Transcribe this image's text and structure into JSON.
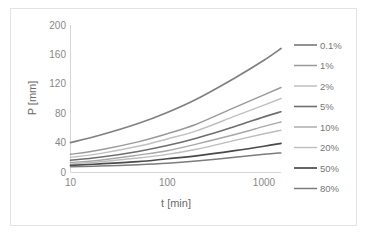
{
  "chart_data": {
    "type": "line",
    "title": "",
    "xlabel": "t [min]",
    "ylabel": "P [mm]",
    "xscale": "log",
    "xlim": [
      10,
      1500
    ],
    "ylim": [
      0,
      200
    ],
    "xticks": [
      10,
      100,
      1000
    ],
    "xtick_labels": [
      "10",
      "100",
      "1000"
    ],
    "yticks": [
      0,
      40,
      80,
      120,
      160,
      200
    ],
    "ytick_labels": [
      "0",
      "40",
      "80",
      "120",
      "160",
      "200"
    ],
    "grid": false,
    "legend_position": "right",
    "x": [
      10,
      20,
      50,
      100,
      200,
      500,
      1000,
      1500
    ],
    "series": [
      {
        "name": "0.1%",
        "color": "#808080",
        "width": 1.7,
        "values": [
          40,
          50,
          66,
          81,
          99,
          128,
          152,
          168
        ]
      },
      {
        "name": "1%",
        "color": "#9a9a9a",
        "width": 1.5,
        "values": [
          24,
          30,
          41,
          52,
          65,
          88,
          105,
          115
        ]
      },
      {
        "name": "2%",
        "color": "#c0c0c0",
        "width": 1.5,
        "values": [
          20,
          25,
          35,
          45,
          56,
          76,
          91,
          100
        ]
      },
      {
        "name": "5%",
        "color": "#6e6e6e",
        "width": 1.6,
        "values": [
          16,
          20,
          28,
          36,
          46,
          62,
          75,
          82
        ]
      },
      {
        "name": "10%",
        "color": "#a8a8a8",
        "width": 1.4,
        "values": [
          13,
          16,
          23,
          29,
          38,
          51,
          62,
          68
        ]
      },
      {
        "name": "20%",
        "color": "#bdbdbd",
        "width": 1.4,
        "values": [
          11,
          14,
          19,
          24,
          31,
          43,
          52,
          57
        ]
      },
      {
        "name": "50%",
        "color": "#4a4a4a",
        "width": 1.7,
        "values": [
          9,
          11,
          14,
          18,
          22,
          29,
          35,
          39
        ]
      },
      {
        "name": "80%",
        "color": "#7c7c7c",
        "width": 1.5,
        "values": [
          7,
          8,
          10,
          12,
          15,
          20,
          24,
          26
        ]
      }
    ]
  },
  "axes": {
    "y_title": "P [mm]",
    "x_title": "t [min]"
  },
  "legend": {
    "entries": [
      {
        "label": "0.1%",
        "color": "#808080"
      },
      {
        "label": "1%",
        "color": "#9a9a9a"
      },
      {
        "label": "2%",
        "color": "#c0c0c0"
      },
      {
        "label": "5%",
        "color": "#6e6e6e"
      },
      {
        "label": "10%",
        "color": "#a8a8a8"
      },
      {
        "label": "20%",
        "color": "#bdbdbd"
      },
      {
        "label": "50%",
        "color": "#4a4a4a"
      },
      {
        "label": "80%",
        "color": "#7c7c7c"
      }
    ]
  }
}
